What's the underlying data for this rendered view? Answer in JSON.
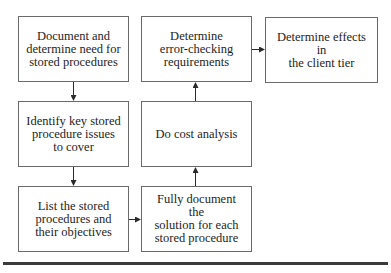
{
  "diagram": {
    "type": "flowchart",
    "nodes": [
      {
        "id": "n1",
        "label": "Document and\ndetermine need for\nstored procedures"
      },
      {
        "id": "n2",
        "label": "Identify key stored\nprocedure issues\nto cover"
      },
      {
        "id": "n3",
        "label": "List the stored\nprocedures and\ntheir objectives"
      },
      {
        "id": "n4",
        "label": "Fully document the\nsolution for each\nstored procedure"
      },
      {
        "id": "n5",
        "label": "Do cost analysis"
      },
      {
        "id": "n6",
        "label": "Determine\nerror-checking\nrequirements"
      },
      {
        "id": "n7",
        "label": "Determine effects in\nthe client tier"
      }
    ],
    "edges": [
      {
        "from": "n1",
        "to": "n2"
      },
      {
        "from": "n2",
        "to": "n3"
      },
      {
        "from": "n3",
        "to": "n4"
      },
      {
        "from": "n4",
        "to": "n5"
      },
      {
        "from": "n5",
        "to": "n6"
      },
      {
        "from": "n6",
        "to": "n7"
      }
    ],
    "colors": {
      "border": "#6a6a6a",
      "text": "#1e1e1e",
      "arrow": "#2a2a2a",
      "rule": "#3a3a3a"
    }
  }
}
